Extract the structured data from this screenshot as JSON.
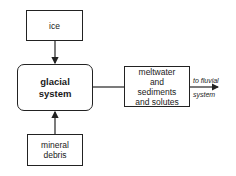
{
  "diagram": {
    "nodes": {
      "ice": {
        "label": "ice"
      },
      "glacial_system": {
        "line1": "glacial",
        "line2": "system"
      },
      "mineral_debris": {
        "line1": "mineral",
        "line2": "debris"
      },
      "outputs": {
        "line1": "meltwater",
        "line2": "and",
        "line3": "sediments",
        "line4": "and solutes"
      }
    },
    "output_label": {
      "line1": "to fluvial",
      "line2": "system"
    },
    "edges": [
      {
        "from": "ice",
        "to": "glacial system"
      },
      {
        "from": "mineral debris",
        "to": "glacial system"
      },
      {
        "from": "glacial system",
        "to": "meltwater and sediments and solutes"
      },
      {
        "from": "meltwater and sediments and solutes",
        "to": "fluvial system"
      }
    ],
    "colors": {
      "stroke": "#222222",
      "background": "#ffffff"
    }
  }
}
